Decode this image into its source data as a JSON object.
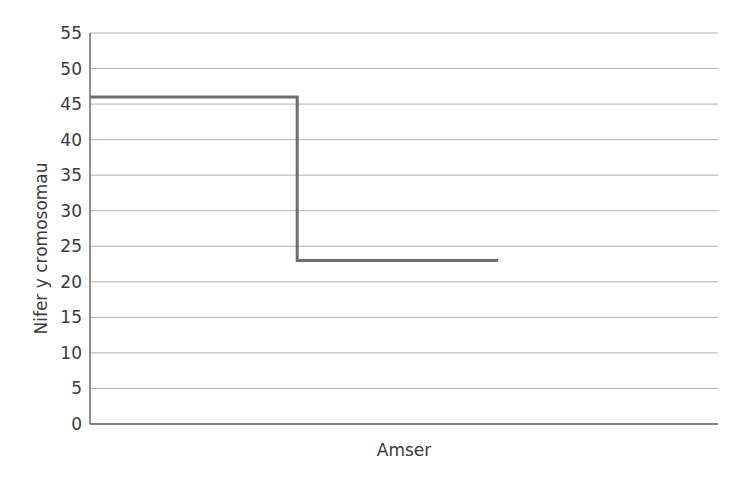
{
  "chart_data": {
    "type": "line",
    "step": true,
    "title": "",
    "xlabel": "Amser",
    "ylabel": "Nifer y cromosomau",
    "ylim": [
      0,
      55
    ],
    "yticks": [
      0,
      5,
      10,
      15,
      20,
      25,
      30,
      35,
      40,
      45,
      50,
      55
    ],
    "grid": true,
    "legend": null,
    "series": [
      {
        "name": "Nifer y cromosomau",
        "color": "#6e6e6e",
        "points": [
          {
            "x": 0.0,
            "y": 46
          },
          {
            "x": 0.33,
            "y": 46
          },
          {
            "x": 0.33,
            "y": 23
          },
          {
            "x": 0.65,
            "y": 23
          }
        ]
      }
    ]
  },
  "colors": {
    "line": "#6e6e6e",
    "grid": "#b0b0b0",
    "axis": "#555555",
    "text": "#3a3a3a"
  }
}
